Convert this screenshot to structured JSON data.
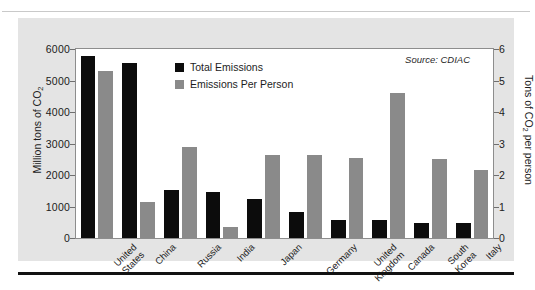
{
  "legend": {
    "position": "inside-top-left",
    "entries": [
      {
        "label": "Total Emissions",
        "color": "#0c0c0c",
        "axis": "left"
      },
      {
        "label": "Emissions Per Person",
        "color": "#8a8a8a",
        "axis": "right"
      }
    ]
  },
  "annotation": {
    "source": "Source: CDIAC"
  },
  "axes": {
    "left": {
      "title_main": "Million tons of CO",
      "title_sub": "2",
      "ticks": [
        "6000",
        "5000",
        "4000",
        "3000",
        "2000",
        "1000",
        "0"
      ]
    },
    "right": {
      "title_pre": "Tons of CO",
      "title_sub": "2",
      "title_post": " per person",
      "ticks": [
        "6",
        "5",
        "4",
        "3",
        "2",
        "1",
        "0"
      ]
    }
  },
  "chart_data": {
    "type": "bar",
    "title": "",
    "subtitle": "",
    "xlabel": "",
    "ylabel": "Million tons of CO2",
    "y2label": "Tons of CO2 per person",
    "ylim": [
      0,
      6000
    ],
    "y2lim": [
      0,
      6
    ],
    "grid": false,
    "legend_position": "inside-top-left",
    "annotations": [
      "Source: CDIAC"
    ],
    "categories": [
      "United States",
      "China",
      "Russia",
      "India",
      "Japan",
      "Germany",
      "United Kingdom",
      "Canada",
      "South Korea",
      "Italy"
    ],
    "category_label_lines": [
      [
        "United",
        "States"
      ],
      [
        "China"
      ],
      [
        "Russia"
      ],
      [
        "India"
      ],
      [
        "Japan"
      ],
      [
        "Germany"
      ],
      [
        "United",
        "Kingdom"
      ],
      [
        "Canada"
      ],
      [
        "South",
        "Korea"
      ],
      [
        "Italy"
      ]
    ],
    "series": [
      {
        "name": "Total Emissions",
        "axis": "left",
        "units": "Million tons of CO2",
        "color": "#0c0c0c",
        "values": [
          5790,
          5550,
          1520,
          1450,
          1250,
          830,
          580,
          570,
          490,
          470
        ]
      },
      {
        "name": "Emissions Per Person",
        "axis": "right",
        "units": "Tons of CO2 per person",
        "color": "#8a8a8a",
        "values": [
          5.3,
          1.15,
          2.9,
          0.35,
          2.65,
          2.65,
          2.55,
          4.6,
          2.5,
          2.15
        ]
      }
    ]
  },
  "style": {
    "panel_background": "#e4e4e4",
    "plot_background": "#ffffff",
    "plot_border": "#8d8d8d",
    "text_color": "#1d1d1d",
    "rule_color": "#121212"
  }
}
